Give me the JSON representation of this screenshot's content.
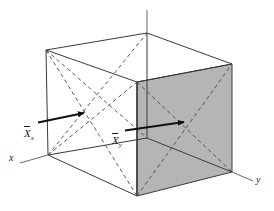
{
  "figure": {
    "kind": "3d-cube-vector-diagram",
    "background_color": "#ffffff",
    "stroke_color": "#3a3a3a",
    "shaded_face_color": "#b5b5b5",
    "arrow_color": "#111111",
    "labels": {
      "axis_x": "x",
      "axis_y": "y",
      "vector_x_base": "X",
      "vector_x_sub": "x",
      "vector_y_base": "X",
      "vector_y_sub": "y"
    },
    "geometry": {
      "cube_vertices": {
        "back_top_left": [
          46,
          50
        ],
        "back_top_right": [
          147,
          33
        ],
        "front_top_left": [
          137,
          82
        ],
        "front_top_right": [
          232,
          64
        ],
        "back_bottom_left": [
          48,
          155
        ],
        "back_bottom_right": [
          147,
          138
        ],
        "front_bottom_left": [
          137,
          196
        ],
        "front_bottom_right": [
          232,
          172
        ]
      },
      "vertical_axis": [
        [
          147,
          10
        ],
        [
          147,
          33
        ]
      ],
      "x_axis_tail": [
        20,
        163
      ],
      "y_axis_head": [
        253,
        181
      ],
      "arrow_x": {
        "from": [
          38,
          122
        ],
        "to": [
          86,
          112
        ]
      },
      "arrow_y": {
        "from": [
          125,
          130
        ],
        "to": [
          186,
          122
        ]
      }
    },
    "dashed_faces": [
      "left-face-diagonals",
      "right-shaded-face-diagonals"
    ]
  }
}
